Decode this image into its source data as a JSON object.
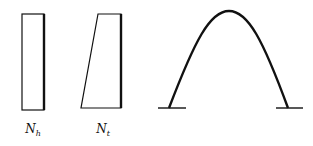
{
  "diagram": {
    "colors": {
      "stroke": "#111111",
      "background": "#ffffff"
    },
    "shapes": [
      {
        "id": "rectangle",
        "label_main": "N",
        "label_sub": "h"
      },
      {
        "id": "trapezoid",
        "label_main": "N",
        "label_sub": "t"
      },
      {
        "id": "arch",
        "label_main": "",
        "label_sub": ""
      }
    ]
  }
}
